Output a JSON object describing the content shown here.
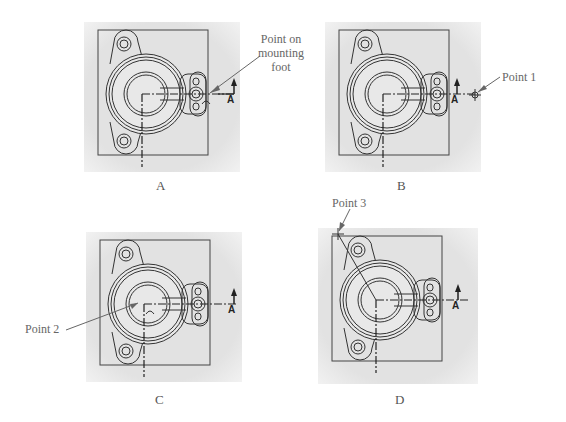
{
  "figure": {
    "panels": [
      {
        "id": "A",
        "caption": "A",
        "callout": {
          "lines": [
            "Point on",
            "mounting",
            "foot"
          ]
        },
        "section_label": "A"
      },
      {
        "id": "B",
        "caption": "B",
        "callout": {
          "text": "Point 1"
        },
        "section_label": "A"
      },
      {
        "id": "C",
        "caption": "C",
        "callout": {
          "text": "Point 2"
        },
        "section_label": "A"
      },
      {
        "id": "D",
        "caption": "D",
        "callout": {
          "text": "Point 3"
        },
        "section_label": "A"
      }
    ],
    "colors": {
      "background": "#ffffff",
      "panel_fill": "#e4e4e4",
      "line": "#333333",
      "text": "#555555"
    }
  }
}
